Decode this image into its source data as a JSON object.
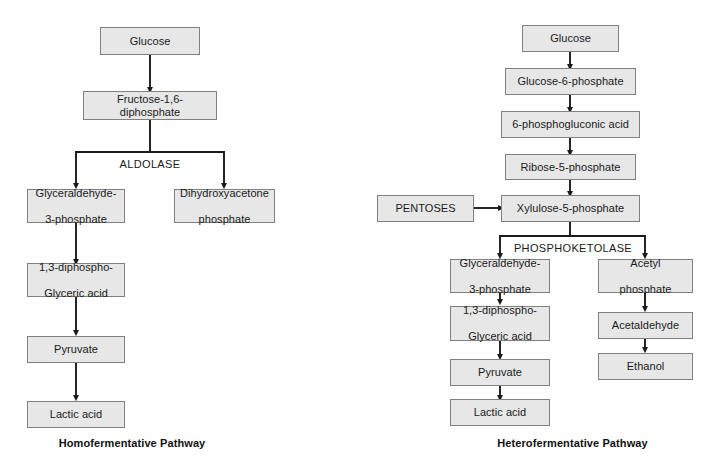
{
  "diagram": {
    "colors": {
      "node_fill": "#e7e7e7",
      "node_border": "#808080",
      "connector": "#1a1a1a",
      "background": "#ffffff",
      "text": "#1a1a1a"
    }
  },
  "homofermentative": {
    "caption": "Homofermentative Pathway",
    "enzymes": [
      {
        "name": "aldolase",
        "label": "ALDOLASE"
      }
    ],
    "nodes": {
      "glucose": {
        "label": "Glucose"
      },
      "fructose_16_diphosphate": {
        "label": "Fructose-1,6-diphosphate"
      },
      "glyceraldehyde_3_phosphate": {
        "line1": "Glyceraldehyde-",
        "line2": "3-phosphate"
      },
      "dihydroxyacetone_phosphate": {
        "line1": "Dihydroxyacetone",
        "line2": "phosphate"
      },
      "diphosphoglyceric_acid": {
        "line1": "1,3-diphospho-",
        "line2": "Glyceric acid"
      },
      "pyruvate": {
        "label": "Pyruvate"
      },
      "lactic_acid": {
        "label": "Lactic acid"
      }
    }
  },
  "heterofermentative": {
    "caption": "Heterofermentative Pathway",
    "enzymes": [
      {
        "name": "phosphoketolase",
        "label": "PHOSPHOKETOLASE"
      }
    ],
    "nodes": {
      "glucose": {
        "label": "Glucose"
      },
      "glucose_6_phosphate": {
        "label": "Glucose-6-phosphate"
      },
      "phosphogluconic_acid": {
        "label": "6-phosphogluconic acid"
      },
      "ribose_5_phosphate": {
        "label": "Ribose-5-phosphate"
      },
      "pentoses": {
        "label": "PENTOSES"
      },
      "xylulose_5_phosphate": {
        "label": "Xylulose-5-phosphate"
      },
      "glyceraldehyde_3_phosphate": {
        "line1": "Glyceraldehyde-",
        "line2": "3-phosphate"
      },
      "acetyl_phosphate": {
        "line1": "Acetyl",
        "line2": "phosphate"
      },
      "diphosphoglyceric_acid": {
        "line1": "1,3-diphospho-",
        "line2": "Glyceric acid"
      },
      "acetaldehyde": {
        "label": "Acetaldehyde"
      },
      "pyruvate": {
        "label": "Pyruvate"
      },
      "ethanol": {
        "label": "Ethanol"
      },
      "lactic_acid": {
        "label": "Lactic acid"
      }
    }
  }
}
